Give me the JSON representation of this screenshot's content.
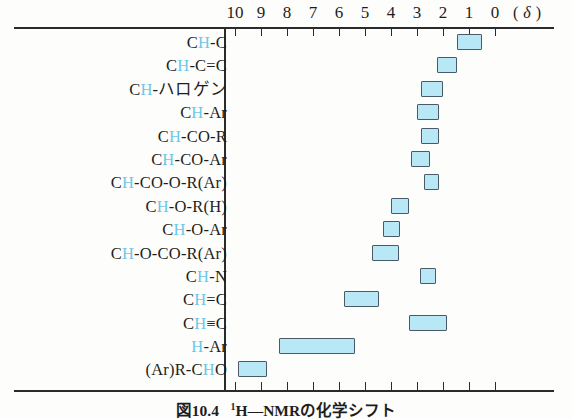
{
  "axis": {
    "ticks": [
      10,
      9,
      8,
      7,
      6,
      5,
      4,
      3,
      2,
      1,
      0
    ],
    "unit_label": "( δ )",
    "unit_symbol": "δ",
    "min": 0,
    "max": 10
  },
  "caption": {
    "figure_number": "図10.4",
    "superscript": "1",
    "text": "H—NMRの化学シフト"
  },
  "chart_data": {
    "type": "bar",
    "orientation": "horizontal-range",
    "xlabel": "δ",
    "ylabel": "",
    "xlim": [
      10,
      0
    ],
    "x_axis_reversed": true,
    "grid": false,
    "legend": false,
    "bar_color": "#b8e8f5",
    "bar_border_color": "#4a5a66",
    "highlight_color": "#6cc7e8",
    "categories": [
      "CH-C",
      "CH-C=C",
      "CH-ハロゲン",
      "CH-Ar",
      "CH-CO-R",
      "CH-CO-Ar",
      "CH-CO-O-R(Ar)",
      "CH-O-R(H)",
      "CH-O-Ar",
      "CH-O-CO-R(Ar)",
      "CH-N",
      "CH=C",
      "CH≡C",
      "H-Ar",
      "(Ar)R-CHO"
    ],
    "ranges": [
      {
        "label": "CH-C",
        "start": 1.45,
        "end": 0.5
      },
      {
        "label": "CH-C=C",
        "start": 2.25,
        "end": 1.45
      },
      {
        "label": "CH-ハロゲン",
        "start": 2.85,
        "end": 2.0
      },
      {
        "label": "CH-Ar",
        "start": 3.0,
        "end": 2.15
      },
      {
        "label": "CH-CO-R",
        "start": 2.85,
        "end": 2.15
      },
      {
        "label": "CH-CO-Ar",
        "start": 3.25,
        "end": 2.5
      },
      {
        "label": "CH-CO-O-R(Ar)",
        "start": 2.75,
        "end": 2.15
      },
      {
        "label": "CH-O-R(H)",
        "start": 4.0,
        "end": 3.3
      },
      {
        "label": "CH-O-Ar",
        "start": 4.3,
        "end": 3.65
      },
      {
        "label": "CH-O-CO-R(Ar)",
        "start": 4.75,
        "end": 3.7
      },
      {
        "label": "CH-N",
        "start": 2.9,
        "end": 2.25
      },
      {
        "label": "CH=C",
        "start": 5.8,
        "end": 4.45
      },
      {
        "label": "CH≡C",
        "start": 3.3,
        "end": 1.85
      },
      {
        "label": "H-Ar",
        "start": 8.3,
        "end": 5.4
      },
      {
        "label": "(Ar)R-CHO",
        "start": 9.9,
        "end": 8.75
      }
    ]
  },
  "labels": [
    {
      "pre": "C",
      "h": "H",
      "post": "-C"
    },
    {
      "pre": "C",
      "h": "H",
      "post": "-C=C"
    },
    {
      "pre": "C",
      "h": "H",
      "post": "-ハロゲン"
    },
    {
      "pre": "C",
      "h": "H",
      "post": "-Ar"
    },
    {
      "pre": "C",
      "h": "H",
      "post": "-CO-R"
    },
    {
      "pre": "C",
      "h": "H",
      "post": "-CO-Ar"
    },
    {
      "pre": "C",
      "h": "H",
      "post": "-CO-O-R(Ar)"
    },
    {
      "pre": "C",
      "h": "H",
      "post": "-O-R(H)"
    },
    {
      "pre": "C",
      "h": "H",
      "post": "-O-Ar"
    },
    {
      "pre": "C",
      "h": "H",
      "post": "-O-CO-R(Ar)"
    },
    {
      "pre": "C",
      "h": "H",
      "post": "-N"
    },
    {
      "pre": "C",
      "h": "H",
      "post": "=C"
    },
    {
      "pre": "C",
      "h": "H",
      "post": "≡C"
    },
    {
      "pre": "",
      "h": "H",
      "post": "-Ar"
    },
    {
      "pre": "(Ar)R-C",
      "h": "H",
      "post": "O"
    }
  ]
}
